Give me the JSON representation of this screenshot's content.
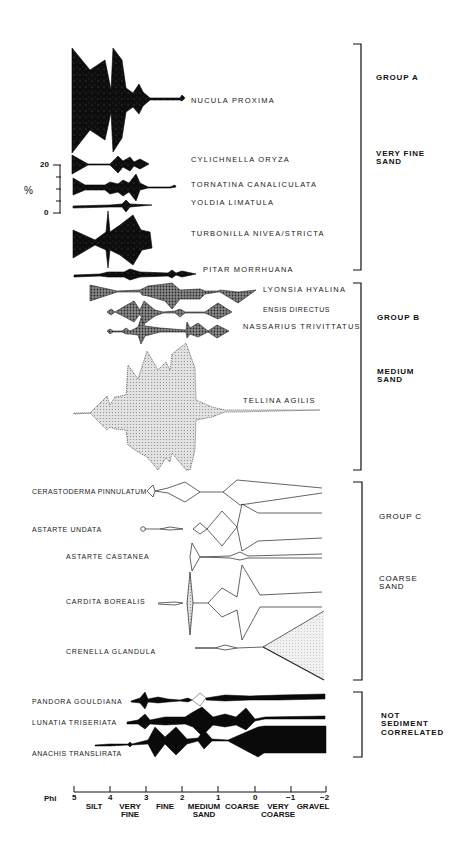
{
  "figure": {
    "scale_bar": {
      "label": "%",
      "max_label": "20",
      "min_label": "0"
    },
    "species": [
      {
        "name": "NUCULA PROXIMA",
        "group": "A",
        "fill": "black"
      },
      {
        "name": "CYLICHNELLA ORYZA",
        "group": "A",
        "fill": "black"
      },
      {
        "name": "TORNATINA CANALICULATA",
        "group": "A",
        "fill": "black"
      },
      {
        "name": "YOLDIA LIMATULA",
        "group": "A",
        "fill": "black"
      },
      {
        "name": "TURBONILLA NIVEA/STRICTA",
        "group": "A",
        "fill": "black"
      },
      {
        "name": "PITAR MORRHUANA",
        "group": "A",
        "fill": "black"
      },
      {
        "name": "LYONSIA HYALINA",
        "group": "B",
        "fill": "dark-stipple"
      },
      {
        "name": "ENSIS DIRECTUS",
        "group": "B",
        "fill": "dark-stipple"
      },
      {
        "name": "NASSARIUS TRIVITTATUS",
        "group": "B",
        "fill": "dark-stipple"
      },
      {
        "name": "TELLINA AGILIS",
        "group": "B",
        "fill": "light-stipple"
      },
      {
        "name": "CERASTODERMA PINNULATUM",
        "group": "C",
        "fill": "open"
      },
      {
        "name": "ASTARTE UNDATA",
        "group": "C",
        "fill": "open"
      },
      {
        "name": "ASTARTE CASTANEA",
        "group": "C",
        "fill": "open"
      },
      {
        "name": "CARDITA BOREALIS",
        "group": "C",
        "fill": "open"
      },
      {
        "name": "CRENELLA GLANDULA",
        "group": "C",
        "fill": "open"
      },
      {
        "name": "PANDORA GOULDIANA",
        "group": "Not sediment correlated",
        "fill": "black"
      },
      {
        "name": "LUNATIA TRISERIATA",
        "group": "Not sediment correlated",
        "fill": "black"
      },
      {
        "name": "ANACHIS TRANSLIRATA",
        "group": "Not sediment correlated",
        "fill": "black"
      }
    ],
    "groups": [
      {
        "title": "GROUP A",
        "sediment": "VERY FINE\nSAND"
      },
      {
        "title": "GROUP B",
        "sediment": "MEDIUM\nSAND"
      },
      {
        "title": "GROUP C",
        "sediment": "COARSE\nSAND"
      },
      {
        "title": "",
        "sediment": "NOT\nSEDIMENT\nCORRELATED"
      }
    ],
    "axis": {
      "label": "Phi",
      "ticks": [
        "5",
        "4",
        "3",
        "2",
        "1",
        "0",
        "−1",
        "−2"
      ],
      "classes": [
        "SILT",
        "VERY\nFINE",
        "FINE",
        "MEDIUM\nSAND",
        "COARSE",
        "VERY\nCOARSE",
        "GRAVEL"
      ]
    }
  }
}
